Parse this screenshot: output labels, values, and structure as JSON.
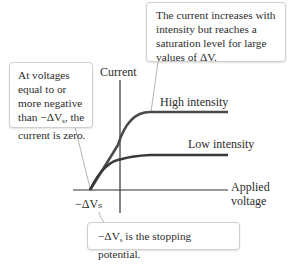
{
  "diagram": {
    "axes": {
      "y_label": "Current",
      "x_label_line1": "Applied",
      "x_label_line2": "voltage",
      "origin_label": "−ΔVₛ"
    },
    "curves": [
      {
        "name": "high-intensity",
        "label": "High intensity",
        "color": "#4a4a4a"
      },
      {
        "name": "low-intensity",
        "label": "Low intensity",
        "color": "#3a3a3a"
      }
    ],
    "callouts": {
      "top": "The current increases with intensity but reaches a saturation level for large values of ΔV.",
      "left_line1": "At voltages",
      "left_line2": "equal to or",
      "left_line3": "more negative",
      "left_line4_prefix": "than −ΔV",
      "left_line4_sub": "s",
      "left_line4_suffix": ", the",
      "left_line5": "current is zero.",
      "bottom_prefix": "−ΔV",
      "bottom_sub": "s",
      "bottom_suffix": " is the stopping potential."
    },
    "colors": {
      "axis": "#333333",
      "callout_border": "#cfcfcf",
      "leader_line": "#b5b5b5"
    }
  }
}
